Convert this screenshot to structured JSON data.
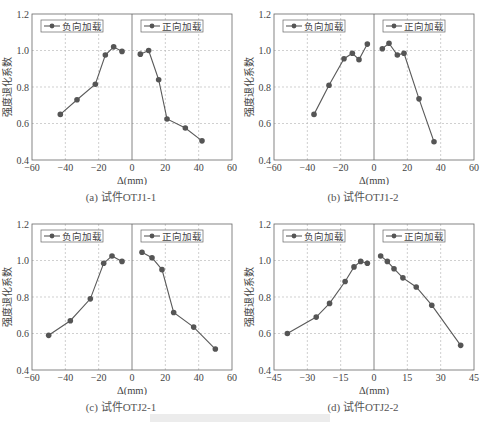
{
  "figure": {
    "panels": [
      {
        "id": "a",
        "caption": "(a) 试件OTJ1-1"
      },
      {
        "id": "b",
        "caption": "(b) 试件OTJ1-2"
      },
      {
        "id": "c",
        "caption": "(c) 试件OTJ2-1"
      },
      {
        "id": "d",
        "caption": "(d) 试件OTJ2-2"
      }
    ]
  },
  "colors": {
    "line": "#5a5a5a",
    "marker": "#555555",
    "grid": "#bbbbbb",
    "axis": "#666666",
    "text": "#444444"
  },
  "chart_data": [
    {
      "type": "line",
      "title": "(a) 试件OTJ1-1",
      "xlabel": "Δ(mm)",
      "ylabel": "强度退化系数",
      "xlim": [
        -60,
        60
      ],
      "ylim": [
        0.4,
        1.2
      ],
      "xticks": [
        -60,
        -40,
        -20,
        0,
        20,
        40,
        60
      ],
      "yticks": [
        0.4,
        0.6,
        0.8,
        1.0,
        1.2
      ],
      "grid": true,
      "legend": [
        "负向加载",
        "正向加载"
      ],
      "series": [
        {
          "name": "负向加载",
          "x": [
            -43,
            -33,
            -22,
            -16,
            -11,
            -6
          ],
          "y": [
            0.65,
            0.73,
            0.815,
            0.975,
            1.02,
            0.995
          ]
        },
        {
          "name": "正向加载",
          "x": [
            5,
            10,
            16,
            21,
            32,
            42
          ],
          "y": [
            0.98,
            1.0,
            0.84,
            0.625,
            0.575,
            0.505
          ]
        }
      ]
    },
    {
      "type": "line",
      "title": "(b) 试件OTJ1-2",
      "xlabel": "Δ(mm)",
      "ylabel": "强度退化系数",
      "xlim": [
        -60,
        60
      ],
      "ylim": [
        0.4,
        1.2
      ],
      "xticks": [
        -60,
        -40,
        -20,
        0,
        20,
        40,
        60
      ],
      "yticks": [
        0.4,
        0.6,
        0.8,
        1.0,
        1.2
      ],
      "grid": true,
      "legend": [
        "负向加载",
        "正向加载"
      ],
      "series": [
        {
          "name": "负向加载",
          "x": [
            -36,
            -27,
            -18,
            -13,
            -9,
            -4
          ],
          "y": [
            0.65,
            0.81,
            0.955,
            0.985,
            0.95,
            1.035
          ]
        },
        {
          "name": "正向加载",
          "x": [
            5,
            9,
            14,
            18,
            27,
            36
          ],
          "y": [
            1.01,
            1.04,
            0.975,
            0.985,
            0.735,
            0.5
          ]
        }
      ]
    },
    {
      "type": "line",
      "title": "(c) 试件OTJ2-1",
      "xlabel": "Δ(mm)",
      "ylabel": "强度退化系数",
      "xlim": [
        -60,
        60
      ],
      "ylim": [
        0.4,
        1.2
      ],
      "xticks": [
        -60,
        -40,
        -20,
        0,
        20,
        40,
        60
      ],
      "yticks": [
        0.4,
        0.6,
        0.8,
        1.0,
        1.2
      ],
      "grid": true,
      "legend": [
        "负向加载",
        "正向加载"
      ],
      "series": [
        {
          "name": "负向加载",
          "x": [
            -50,
            -37,
            -25,
            -17,
            -12,
            -6
          ],
          "y": [
            0.59,
            0.67,
            0.79,
            0.985,
            1.025,
            0.995
          ]
        },
        {
          "name": "正向加载",
          "x": [
            6,
            12,
            18,
            25,
            37,
            50
          ],
          "y": [
            1.045,
            1.015,
            0.95,
            0.715,
            0.635,
            0.515
          ]
        }
      ]
    },
    {
      "type": "line",
      "title": "(d) 试件OTJ2-2",
      "xlabel": "Δ(mm)",
      "ylabel": "强度退化系数",
      "xlim": [
        -45,
        45
      ],
      "ylim": [
        0.4,
        1.2
      ],
      "xticks": [
        -45,
        -30,
        -15,
        0,
        15,
        30,
        45
      ],
      "yticks": [
        0.4,
        0.6,
        0.8,
        1.0,
        1.2
      ],
      "grid": true,
      "legend": [
        "负向加载",
        "正向加载"
      ],
      "series": [
        {
          "name": "负向加载",
          "x": [
            -39,
            -26,
            -20,
            -13,
            -9,
            -6,
            -3
          ],
          "y": [
            0.6,
            0.69,
            0.765,
            0.885,
            0.965,
            0.995,
            0.985
          ]
        },
        {
          "name": "正向加载",
          "x": [
            3,
            6,
            9,
            13,
            19,
            26,
            39
          ],
          "y": [
            1.025,
            0.995,
            0.955,
            0.905,
            0.855,
            0.755,
            0.535
          ]
        }
      ]
    }
  ]
}
